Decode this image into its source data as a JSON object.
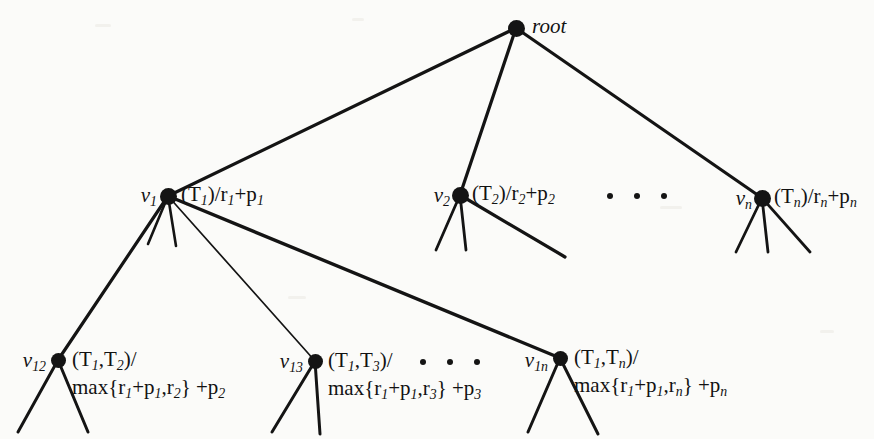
{
  "figure": {
    "type": "tree-diagram",
    "background_color": "#fbfbf9",
    "ink_color": "#141414",
    "width": 874,
    "height": 439
  },
  "nodes": {
    "root": {
      "name": "root",
      "name_html": "root",
      "value_html": "",
      "x": 516,
      "y": 28
    },
    "v1": {
      "name": "v1",
      "name_html": "v<sub>1</sub>",
      "value_html": "(T<sub>1</sub>)/r<sub>1</sub>+p<sub>1</sub>",
      "x": 168,
      "y": 196
    },
    "v2": {
      "name": "v2",
      "name_html": "v<sub>2</sub>",
      "value_html": "(T<sub>2</sub>)/r<sub>2</sub>+p<sub>2</sub>",
      "x": 460,
      "y": 195
    },
    "vn": {
      "name": "vn",
      "name_html": "v<sub>n</sub>",
      "value_html": "(T<sub>n</sub>)/r<sub>n</sub>+p<sub>n</sub>",
      "x": 762,
      "y": 198
    },
    "v12": {
      "name": "v12",
      "name_html": "v<sub>12</sub>",
      "value_line1_html": "(T<sub>1</sub>,T<sub>2</sub>)/",
      "value_line2_html": "max{r<sub>1</sub>+p<sub>1</sub>,r<sub>2</sub>} +p<sub>2</sub>",
      "x": 58,
      "y": 360
    },
    "v13": {
      "name": "v13",
      "name_html": "v<sub>13</sub>",
      "value_line1_html": "(T<sub>1</sub>,T<sub>3</sub>)/",
      "value_line2_html": "max{r<sub>1</sub>+p<sub>1</sub>,r<sub>3</sub>} +p<sub>3</sub>",
      "x": 315,
      "y": 361
    },
    "v1n": {
      "name": "v1n",
      "name_html": "v<sub>1n</sub>",
      "value_line1_html": "(T<sub>1</sub>,T<sub>n</sub>)/",
      "value_line2_html": "max{r<sub>1</sub>+p<sub>1</sub>,r<sub>n</sub>} +p<sub>n</sub>",
      "x": 560,
      "y": 358
    }
  },
  "ellipses": [
    {
      "name": "ellipsis-level1",
      "x": 607,
      "y": 196,
      "dots": 3
    },
    {
      "name": "ellipsis-level2",
      "x": 420,
      "y": 362,
      "dots": 3
    }
  ],
  "edges": [
    {
      "name": "edge-root-v1",
      "from": "root",
      "to": "v1",
      "width": 3.2
    },
    {
      "name": "edge-root-v2",
      "from": "root",
      "to": "v2",
      "width": 3.2
    },
    {
      "name": "edge-root-vn",
      "from": "root",
      "to": "vn",
      "width": 3.2
    },
    {
      "name": "edge-v1-v12",
      "from": "v1",
      "to": "v12",
      "width": 3.2
    },
    {
      "name": "edge-v1-v13",
      "from": "v1",
      "to": "v13",
      "width": 1.7
    },
    {
      "name": "edge-v1-v1n",
      "from": "v1",
      "to": "v1n",
      "width": 3.4
    }
  ],
  "leaf_stubs": [
    {
      "name": "stub-v1-a",
      "x1": 168,
      "y1": 196,
      "x2": 148,
      "y2": 244,
      "width": 2.6
    },
    {
      "name": "stub-v1-b",
      "x1": 168,
      "y1": 196,
      "x2": 176,
      "y2": 246,
      "width": 2.6
    },
    {
      "name": "stub-v2-a",
      "x1": 460,
      "y1": 195,
      "x2": 436,
      "y2": 250,
      "width": 2.8
    },
    {
      "name": "stub-v2-b",
      "x1": 460,
      "y1": 195,
      "x2": 466,
      "y2": 250,
      "width": 2.8
    },
    {
      "name": "stub-v2-c",
      "x1": 460,
      "y1": 195,
      "x2": 565,
      "y2": 257,
      "width": 3.2
    },
    {
      "name": "stub-vn-a",
      "x1": 762,
      "y1": 198,
      "x2": 736,
      "y2": 252,
      "width": 2.8
    },
    {
      "name": "stub-vn-b",
      "x1": 762,
      "y1": 198,
      "x2": 768,
      "y2": 252,
      "width": 2.8
    },
    {
      "name": "stub-vn-c",
      "x1": 762,
      "y1": 198,
      "x2": 810,
      "y2": 252,
      "width": 2.8
    },
    {
      "name": "stub-v12-a",
      "x1": 58,
      "y1": 360,
      "x2": 18,
      "y2": 432,
      "width": 3.0
    },
    {
      "name": "stub-v12-b",
      "x1": 58,
      "y1": 360,
      "x2": 88,
      "y2": 432,
      "width": 3.0
    },
    {
      "name": "stub-v13-a",
      "x1": 315,
      "y1": 361,
      "x2": 272,
      "y2": 432,
      "width": 3.0
    },
    {
      "name": "stub-v13-b",
      "x1": 315,
      "y1": 361,
      "x2": 320,
      "y2": 434,
      "width": 3.0
    },
    {
      "name": "stub-v1n-a",
      "x1": 560,
      "y1": 358,
      "x2": 528,
      "y2": 432,
      "width": 3.0
    },
    {
      "name": "stub-v1n-b",
      "x1": 560,
      "y1": 358,
      "x2": 598,
      "y2": 434,
      "width": 3.0
    }
  ],
  "label_positions": {
    "root_name": {
      "x": 532,
      "y": 27
    },
    "v1_name": {
      "x": 157,
      "y": 197
    },
    "v1_value": {
      "x": 181,
      "y": 196
    },
    "v2_name": {
      "x": 450,
      "y": 197
    },
    "v2_value": {
      "x": 472,
      "y": 195
    },
    "vn_name": {
      "x": 752,
      "y": 200
    },
    "vn_value": {
      "x": 774,
      "y": 198
    },
    "v12_name": {
      "x": 46,
      "y": 362
    },
    "v12_value": {
      "x": 72,
      "y": 375
    },
    "v13_name": {
      "x": 303,
      "y": 363
    },
    "v13_value": {
      "x": 328,
      "y": 376
    },
    "v1n_name": {
      "x": 548,
      "y": 362
    },
    "v1n_value": {
      "x": 574,
      "y": 373
    }
  }
}
